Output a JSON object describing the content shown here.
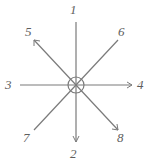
{
  "diagram": {
    "type": "ray-star-diagram",
    "stroke_color": "#7a7a7a",
    "label_color": "#5e5e5e",
    "background_color": "#ffffff",
    "center": {
      "x": 76,
      "y": 85,
      "circle_radius": 8
    },
    "rays": [
      {
        "id": "ray-1",
        "label": "1",
        "direction": "up",
        "angle_deg": 90,
        "end": {
          "x": 76,
          "y": 22
        },
        "label_pos": {
          "x": 72,
          "y": 4
        }
      },
      {
        "id": "ray-2",
        "label": "2",
        "direction": "down",
        "angle_deg": 270,
        "end": {
          "x": 76,
          "y": 142
        },
        "label_pos": {
          "x": 72,
          "y": 148
        }
      },
      {
        "id": "ray-3",
        "label": "3",
        "direction": "left",
        "angle_deg": 180,
        "end": {
          "x": 20,
          "y": 85
        },
        "label_pos": {
          "x": 6,
          "y": 78
        }
      },
      {
        "id": "ray-4",
        "label": "4",
        "direction": "right",
        "angle_deg": 0,
        "end": {
          "x": 132,
          "y": 85
        },
        "label_pos": {
          "x": 136,
          "y": 78
        }
      },
      {
        "id": "ray-5",
        "label": "5",
        "direction": "up-left",
        "angle_deg": 135,
        "end": {
          "x": 34,
          "y": 40
        },
        "label_pos": {
          "x": 26,
          "y": 26
        }
      },
      {
        "id": "ray-6",
        "label": "6",
        "direction": "up-right",
        "angle_deg": 45,
        "end": {
          "x": 118,
          "y": 40
        },
        "label_pos": {
          "x": 118,
          "y": 26
        }
      },
      {
        "id": "ray-7",
        "label": "7",
        "direction": "down-left",
        "angle_deg": 225,
        "end": {
          "x": 34,
          "y": 130
        },
        "label_pos": {
          "x": 24,
          "y": 132
        }
      },
      {
        "id": "ray-8",
        "label": "8",
        "direction": "down-right",
        "angle_deg": 315,
        "end": {
          "x": 118,
          "y": 130
        },
        "label_pos": {
          "x": 116,
          "y": 132
        }
      }
    ]
  }
}
